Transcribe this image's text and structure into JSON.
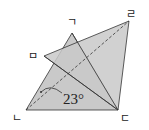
{
  "diagram": {
    "type": "geometry",
    "fill_color": "#c9c9c9",
    "stroke_color": "#333333",
    "points": {
      "giyeok": {
        "label": "ㄱ",
        "x": 72,
        "y": 33
      },
      "rieul": {
        "label": "ㄹ",
        "x": 129,
        "y": 21
      },
      "mieum": {
        "label": "ㅁ",
        "x": 44,
        "y": 56
      },
      "nieun": {
        "label": "ㄴ",
        "x": 26,
        "y": 110
      },
      "digeut": {
        "label": "ㄷ",
        "x": 118,
        "y": 110
      }
    },
    "triangles": [
      [
        "ㄱ",
        "ㄴ",
        "ㄷ"
      ],
      [
        "ㅁ",
        "ㄹ",
        "ㄷ"
      ]
    ],
    "dashed_segment": [
      "ㄴ",
      "ㄹ"
    ],
    "angle_label": "23°"
  }
}
